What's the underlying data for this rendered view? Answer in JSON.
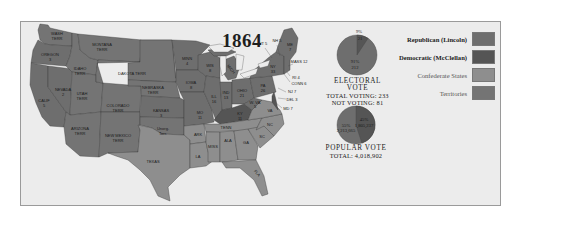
{
  "map": {
    "title": "1864",
    "colors": {
      "republican": "#6e6e6e",
      "democratic": "#555555",
      "confederate": "#8e8e8e",
      "territories": "#747474",
      "water": "#ececec",
      "border": "#3a3a3a"
    },
    "regions": {
      "wash": {
        "name": "WASH",
        "line2": "TERR",
        "type": "territory"
      },
      "oregon": {
        "name": "OREGON",
        "line2": "3",
        "type": "republican"
      },
      "calif": {
        "name": "CALIF",
        "line2": "5",
        "type": "republican"
      },
      "nevada": {
        "name": "NEVADA",
        "line2": "2",
        "type": "republican"
      },
      "idaho": {
        "name": "IDAHO",
        "line2": "TERR",
        "type": "territory"
      },
      "montana": {
        "name": "MONTANA",
        "line2": "TERR",
        "type": "territory"
      },
      "utah": {
        "name": "UTAH",
        "line2": "TERR",
        "type": "territory"
      },
      "arizona": {
        "name": "ARIZONA",
        "line2": "TERR",
        "type": "territory"
      },
      "colorado": {
        "name": "COLORADO",
        "line2": "TERR",
        "type": "territory"
      },
      "newmexico": {
        "name": "NEW MEXICO",
        "line2": "TERR",
        "type": "territory"
      },
      "dakota": {
        "name": "DAKOTA TERR",
        "line2": "",
        "type": "territory"
      },
      "nebraska": {
        "name": "NEBRASKA",
        "line2": "TERR",
        "type": "territory"
      },
      "kansas": {
        "name": "KANSAS",
        "line2": "3",
        "type": "republican"
      },
      "unorg": {
        "name": "Unorg.",
        "line2": "Terr.",
        "type": "territory"
      },
      "texas": {
        "name": "TEXAS",
        "line2": "",
        "type": "confederate"
      },
      "minn": {
        "name": "MINN",
        "line2": "4",
        "type": "republican"
      },
      "iowa": {
        "name": "IOWA",
        "line2": "8",
        "type": "republican"
      },
      "mo": {
        "name": "MO",
        "line2": "11",
        "type": "republican"
      },
      "ark": {
        "name": "ARK",
        "line2": "",
        "type": "confederate"
      },
      "la": {
        "name": "LA",
        "line2": "",
        "type": "confederate"
      },
      "wis": {
        "name": "WIS",
        "line2": "8",
        "type": "republican"
      },
      "ill": {
        "name": "ILL",
        "line2": "16",
        "type": "republican"
      },
      "mich": {
        "name": "MICH",
        "line2": "8",
        "type": "republican"
      },
      "ind": {
        "name": "IND",
        "line2": "13",
        "type": "republican"
      },
      "ohio": {
        "name": "OHIO",
        "line2": "21",
        "type": "republican"
      },
      "ky": {
        "name": "KY",
        "line2": "11",
        "type": "democratic"
      },
      "tenn": {
        "name": "TENN",
        "line2": "",
        "type": "confederate"
      },
      "miss": {
        "name": "MISS",
        "line2": "",
        "type": "confederate"
      },
      "ala": {
        "name": "ALA",
        "line2": "",
        "type": "confederate"
      },
      "ga": {
        "name": "GA",
        "line2": "",
        "type": "confederate"
      },
      "fla": {
        "name": "FLA",
        "line2": "",
        "type": "confederate"
      },
      "sc": {
        "name": "SC",
        "line2": "",
        "type": "confederate"
      },
      "nc": {
        "name": "NC",
        "line2": "",
        "type": "confederate"
      },
      "va": {
        "name": "VA",
        "line2": "",
        "type": "confederate"
      },
      "wva": {
        "name": "W. VA",
        "line2": "5",
        "type": "republican"
      },
      "pa": {
        "name": "PA",
        "line2": "26",
        "type": "republican"
      },
      "ny": {
        "name": "NY",
        "line2": "33",
        "type": "republican"
      },
      "me": {
        "name": "ME",
        "line2": "7",
        "type": "republican"
      }
    },
    "callouts": {
      "vt": "VT 5",
      "nh": "NH 5",
      "mass": "MASS 12",
      "ri": "RI 4",
      "conn": "CONN 6",
      "nj": "NJ 7",
      "del": "DEL 3",
      "md": "MD 7"
    }
  },
  "electoral_pie": {
    "slices": [
      {
        "label": "91%",
        "value_label": "212",
        "percent": 91,
        "party": "republican"
      },
      {
        "label": "9%",
        "value_label": "21",
        "percent": 9,
        "party": "democratic"
      }
    ],
    "caption_head": "ELECTORAL VOTE",
    "caption_line1": "TOTAL VOTING: 233",
    "caption_line2": "NOT VOTING: 81"
  },
  "popular_pie": {
    "slices": [
      {
        "label": "55%",
        "value_label": "2,213,665",
        "percent": 55,
        "party": "republican"
      },
      {
        "label": "45%",
        "value_label": "1,805,237",
        "percent": 45,
        "party": "democratic"
      }
    ],
    "caption_head": "POPULAR VOTE",
    "caption_line1": "TOTAL: 4,018,902"
  },
  "legend": {
    "items": [
      {
        "label": "Republican (Lincoln)",
        "color": "#6e6e6e"
      },
      {
        "label": "Democratic (McClellan)",
        "color": "#555555"
      },
      {
        "label": "Confederate States",
        "color": "#8e8e8e"
      },
      {
        "label": "Territories",
        "color": "#747474"
      }
    ]
  }
}
